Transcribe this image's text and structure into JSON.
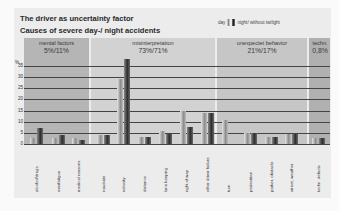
{
  "chart_data": {
    "type": "bar",
    "title": "The driver as uncertainty factor",
    "subtitle": "Causes of severe day-/ night accidents",
    "xlabel": "",
    "ylabel": "%",
    "ylim": [
      0,
      35
    ],
    "yticks": [
      0,
      5,
      10,
      15,
      20,
      25,
      30,
      35
    ],
    "grid": true,
    "legend": {
      "position": "top-right",
      "entries": [
        "day",
        "night/ without twilight"
      ]
    },
    "groups": [
      {
        "label": "mental factors",
        "share": "5%/11%",
        "categories": [
          "alcohol/drugs",
          "overfatigue",
          "medical reasons"
        ]
      },
      {
        "label": "misinterpretation",
        "share": "73%/71%",
        "categories": [
          "roadside",
          "velocity",
          "distance",
          "lane keeping",
          "right of way",
          "other driver failure"
        ]
      },
      {
        "label": "unexpectet behavior",
        "share": "21%/17%",
        "categories": [
          "turn",
          "pedestrian",
          "parker, obstacle",
          "street, weather"
        ]
      },
      {
        "label": "techn.",
        "share": "0,8%",
        "categories": [
          "techn. defects"
        ]
      }
    ],
    "categories": [
      "alcohol/drugs",
      "overfatigue",
      "medical reasons",
      "roadside",
      "velocity",
      "distance",
      "lane keeping",
      "right of way",
      "other driver failure",
      "turn",
      "pedestrian",
      "parker, obstacle",
      "street, weather",
      "techn. defects"
    ],
    "series": [
      {
        "name": "day",
        "values": [
          2.5,
          2.5,
          2.5,
          4,
          29,
          3,
          6,
          15,
          14,
          11,
          5,
          3,
          4.5,
          2.5
        ]
      },
      {
        "name": "night/ without twilight",
        "values": [
          7,
          4,
          2,
          4,
          38,
          3,
          4.5,
          7.5,
          14,
          0,
          5,
          3,
          4.5,
          2.5
        ]
      }
    ]
  },
  "header": {
    "title": "The driver as uncertainty factor",
    "subtitle": "Causes of severe day-/ night accidents",
    "legend_day": "day",
    "legend_night": "night/ without twilight"
  },
  "groups": [
    {
      "label": "mental factors",
      "pct": "5%/11%"
    },
    {
      "label": "misinterpretation",
      "pct": "73%/71%"
    },
    {
      "label": "unexpectet behavior",
      "pct": "21%/17%"
    },
    {
      "label": "techn.",
      "pct": "0,8%"
    }
  ],
  "axis": {
    "unit": "%",
    "ticks": [
      "35",
      "30",
      "25",
      "20",
      "15",
      "10",
      "5",
      "0"
    ]
  },
  "xlabels": [
    "alcohol/drugs",
    "overfatigue",
    "medical reasons",
    "roadside",
    "velocity",
    "distance",
    "lane keeping",
    "right of way",
    "other driver failure",
    "turn",
    "pedestrian",
    "parker, obstacle",
    "street, weather",
    "techn. defects"
  ],
  "colors": {
    "panel": "#ececec",
    "group_dark": "#b9b9b9",
    "group_light": "#d4d4d4",
    "day_bar": "#9a9a9a",
    "night_bar": "#4a4a4a"
  }
}
